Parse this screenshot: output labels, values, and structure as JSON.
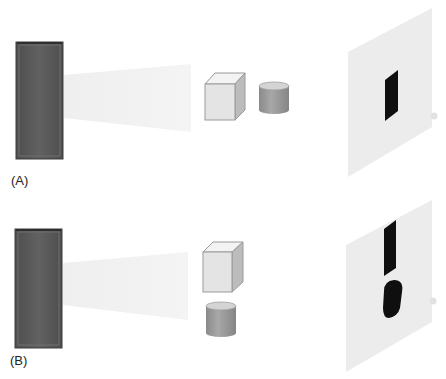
{
  "figure": {
    "panels": [
      {
        "label": "(A)",
        "objects": [
          "cube",
          "cylinder"
        ],
        "arrangement": "side-by-side",
        "shadow": "single rectangular shadow"
      },
      {
        "label": "(B)",
        "objects": [
          "cube",
          "cylinder"
        ],
        "arrangement": "stacked vertically",
        "shadow": "rectangular shadow above oval shadow"
      }
    ]
  },
  "colors": {
    "source": "#5a5a5a",
    "source_edge": "#3a3a3a",
    "beam": "#f1f1f1",
    "cube_front": "#e6e6e6",
    "cube_top": "#f2f2f2",
    "cube_side": "#bdbdbd",
    "cylinder_body": "#9a9a9a",
    "cylinder_top": "#cfcfcf",
    "screen": "#eeeeee",
    "shadow": "#0d0d0d"
  }
}
